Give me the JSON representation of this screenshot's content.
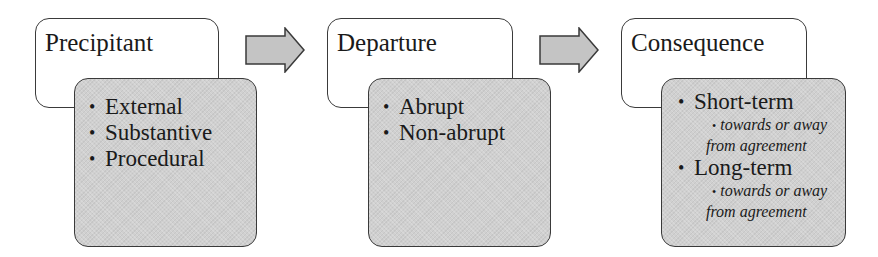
{
  "diagram": {
    "type": "process-flow",
    "stages": [
      {
        "title": "Precipitant",
        "items": [
          {
            "label": "External"
          },
          {
            "label": "Substantive"
          },
          {
            "label": "Procedural"
          }
        ]
      },
      {
        "title": "Departure",
        "items": [
          {
            "label": "Abrupt"
          },
          {
            "label": "Non-abrupt"
          }
        ]
      },
      {
        "title": "Consequence",
        "items": [
          {
            "label": "Short-term",
            "sub_line1": "towards or away",
            "sub_line2": "from agreement"
          },
          {
            "label": "Long-term",
            "sub_line1": "towards or away",
            "sub_line2": "from agreement"
          }
        ]
      }
    ],
    "arrows": [
      {
        "from": "Precipitant",
        "to": "Departure",
        "icon": "right-arrow-icon"
      },
      {
        "from": "Departure",
        "to": "Consequence",
        "icon": "right-arrow-icon"
      }
    ],
    "colors": {
      "title_fill": "#ffffff",
      "detail_fill": "#d0d0d0",
      "arrow_fill": "#c4c4c4",
      "stroke": "#3a3a3a"
    }
  }
}
